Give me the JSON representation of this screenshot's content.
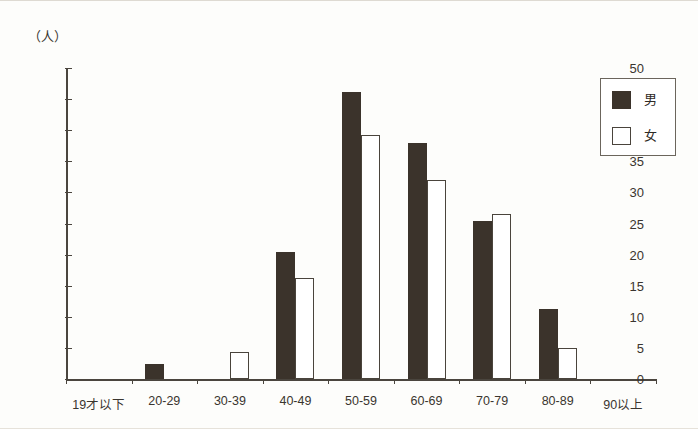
{
  "chart_data": {
    "type": "bar",
    "title": "",
    "xlabel": "",
    "ylabel": "（人）",
    "unit_label": "（人）",
    "ylim": [
      0,
      50
    ],
    "ytick_step": 5,
    "yticks": [
      0,
      5,
      10,
      15,
      20,
      25,
      30,
      35,
      40,
      45,
      50
    ],
    "ytick_labels": [
      "0",
      "5",
      "10",
      "15",
      "20",
      "25",
      "30",
      "35",
      "40",
      "45",
      "50"
    ],
    "grid": false,
    "legend_position": "top-right",
    "categories": [
      "19才以下",
      "20-29",
      "30-39",
      "40-49",
      "50-59",
      "60-69",
      "70-79",
      "80-89",
      "90以上"
    ],
    "series": [
      {
        "name": "男",
        "color": "#3b332b",
        "fill": "solid",
        "values": [
          0,
          2.4,
          0,
          20.5,
          46.2,
          38.0,
          25.4,
          11.2,
          0
        ]
      },
      {
        "name": "女",
        "color": "#ffffff",
        "fill": "outline",
        "values": [
          0,
          0,
          4.3,
          16.2,
          39.3,
          32.0,
          26.6,
          5.0,
          0
        ]
      }
    ]
  },
  "legend": {
    "items": [
      {
        "label": "男",
        "style": "filled"
      },
      {
        "label": "女",
        "style": "outline"
      }
    ]
  },
  "colors": {
    "bar_male": "#3b332b",
    "bar_female": "#ffffff",
    "bar_female_border": "#4a443c",
    "axis": "#4a453e",
    "text": "#3a352f",
    "background": "#fdfdfb"
  }
}
